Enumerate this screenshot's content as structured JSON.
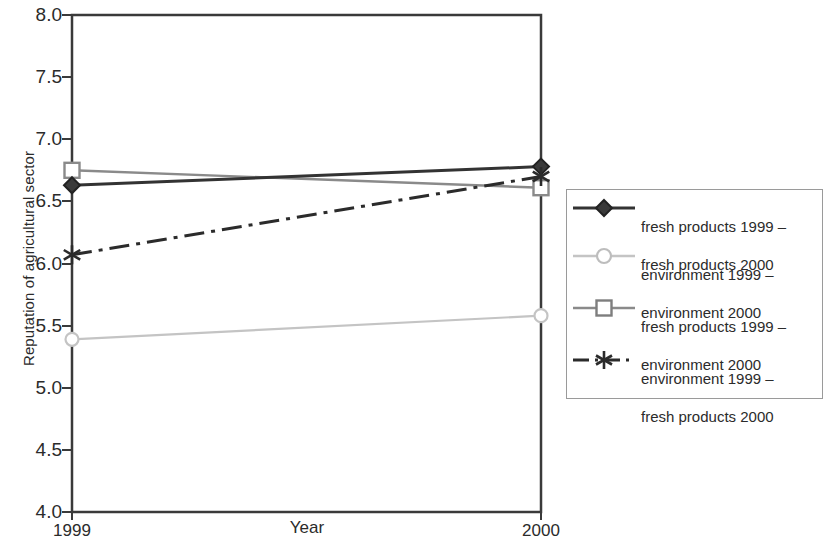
{
  "chart_data": {
    "type": "line",
    "title": "",
    "xlabel": "Year",
    "ylabel": "Reputation of agricultural sector",
    "categories": [
      "1999",
      "2000"
    ],
    "x": [
      1999,
      2000
    ],
    "xlim": [
      1999,
      2000
    ],
    "ylim": [
      4.0,
      8.0
    ],
    "ytick_labels": [
      "8.0",
      "7.5",
      "7.0",
      "6.5",
      "6.0",
      "5.5",
      "5.0",
      "4.5",
      "4.0"
    ],
    "ytick_values": [
      8.0,
      7.5,
      7.0,
      6.5,
      6.0,
      5.5,
      5.0,
      4.5,
      4.0
    ],
    "xtick_labels": [
      "1999",
      "2000"
    ],
    "grid": false,
    "legend_position": "right",
    "series": [
      {
        "name": "fresh products 1999 – fresh products 2000",
        "label_line1": "fresh products 1999 –",
        "label_line2": "fresh products 2000",
        "marker": "diamond",
        "linestyle": "solid",
        "color": "#333333",
        "values": [
          6.63,
          6.78
        ]
      },
      {
        "name": "environment 1999 – environment 2000",
        "label_line1": "environment 1999 –",
        "label_line2": "environment 2000",
        "marker": "circle",
        "linestyle": "solid",
        "color": "#c4c4c4",
        "values": [
          5.39,
          5.58
        ]
      },
      {
        "name": "fresh products 1999 – environment 2000",
        "label_line1": "fresh products 1999 –",
        "label_line2": "environment 2000",
        "marker": "square",
        "linestyle": "solid",
        "color": "#8a8a8a",
        "values": [
          6.75,
          6.61
        ]
      },
      {
        "name": "environment 1999 – fresh products 2000",
        "label_line1": "environment 1999 –",
        "label_line2": "fresh products 2000",
        "marker": "asterisk",
        "linestyle": "dashdot",
        "color": "#2b2b2b",
        "values": [
          6.07,
          6.7
        ]
      }
    ]
  },
  "axes": {
    "y_title": "Reputation of agricultural sector",
    "x_title": "Year",
    "x_left_label": "1999",
    "x_right_label": "2000",
    "y_labels": {
      "t80": "8.0",
      "t75": "7.5",
      "t70": "7.0",
      "t65": "6.5",
      "t60": "6.0",
      "t55": "5.5",
      "t50": "5.0",
      "t45": "4.5",
      "t40": "4.0"
    }
  },
  "legend": {
    "items": [
      {
        "line1": "fresh products 1999 –",
        "line2": "fresh products 2000",
        "marker": "diamond-marker",
        "color": "#333333"
      },
      {
        "line1": "environment 1999 –",
        "line2": "environment 2000",
        "marker": "circle-marker",
        "color": "#c4c4c4"
      },
      {
        "line1": "fresh products 1999 –",
        "line2": "environment 2000",
        "marker": "square-marker",
        "color": "#8a8a8a"
      },
      {
        "line1": "environment 1999 –",
        "line2": "fresh products 2000",
        "marker": "asterisk-marker",
        "color": "#2b2b2b"
      }
    ]
  }
}
